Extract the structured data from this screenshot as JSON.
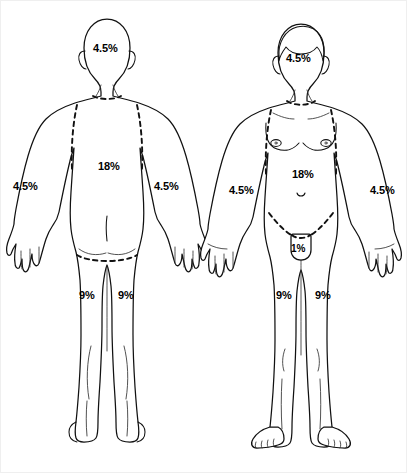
{
  "diagram": {
    "unit": "%",
    "figures": [
      {
        "id": "posterior",
        "view_label": "back view",
        "regions": [
          {
            "name": "head-and-neck",
            "value": "4.5%",
            "x": 92,
            "y": 42
          },
          {
            "name": "posterior-trunk",
            "value": "18%",
            "x": 97,
            "y": 160
          },
          {
            "name": "right-arm",
            "value": "4.5%",
            "x": 12,
            "y": 180
          },
          {
            "name": "left-arm",
            "value": "4.5%",
            "x": 153,
            "y": 180
          },
          {
            "name": "right-leg",
            "value": "9%",
            "x": 78,
            "y": 289
          },
          {
            "name": "left-leg",
            "value": "9%",
            "x": 117,
            "y": 289
          }
        ]
      },
      {
        "id": "anterior",
        "view_label": "front view",
        "regions": [
          {
            "name": "head-and-neck",
            "value": "4.5%",
            "x": 285,
            "y": 52
          },
          {
            "name": "anterior-trunk",
            "value": "18%",
            "x": 291,
            "y": 168
          },
          {
            "name": "right-arm",
            "value": "4.5%",
            "x": 228,
            "y": 184
          },
          {
            "name": "left-arm",
            "value": "4.5%",
            "x": 369,
            "y": 184
          },
          {
            "name": "genitalia",
            "value": "1%",
            "x": 290,
            "y": 243
          },
          {
            "name": "right-leg",
            "value": "9%",
            "x": 275,
            "y": 289
          },
          {
            "name": "left-leg",
            "value": "9%",
            "x": 314,
            "y": 289
          }
        ]
      }
    ]
  }
}
